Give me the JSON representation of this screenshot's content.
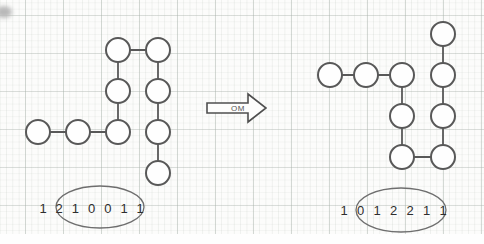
{
  "figure": {
    "arrow": {
      "label": "OM",
      "points": "207,103 248,103 248,94 266,108 248,122 248,113 207,113"
    },
    "structures": [
      {
        "name": "initial-conformation",
        "node_radius": 12,
        "nodes": [
          [
            38,
            132
          ],
          [
            78,
            132
          ],
          [
            118,
            132
          ],
          [
            118,
            91
          ],
          [
            118,
            50
          ],
          [
            158,
            50
          ],
          [
            158,
            91
          ],
          [
            158,
            132
          ],
          [
            158,
            173
          ]
        ],
        "sequence": {
          "digits": [
            "1",
            "2",
            "1",
            "0",
            "0",
            "1",
            "1"
          ],
          "x_start": 43,
          "x_step": 16.2,
          "y": 213
        },
        "ellipse": {
          "cx": 100,
          "cy": 207,
          "rx": 44,
          "ry": 21
        }
      },
      {
        "name": "transformed-conformation",
        "node_radius": 12,
        "nodes": [
          [
            330,
            75
          ],
          [
            366,
            75
          ],
          [
            402,
            75
          ],
          [
            402,
            116
          ],
          [
            402,
            157
          ],
          [
            443,
            157
          ],
          [
            443,
            116
          ],
          [
            443,
            75
          ],
          [
            443,
            34
          ]
        ],
        "sequence": {
          "digits": [
            "1",
            "0",
            "1",
            "2",
            "2",
            "1",
            "1"
          ],
          "x_start": 344,
          "x_step": 16.5,
          "y": 215
        },
        "ellipse": {
          "cx": 401,
          "cy": 210,
          "rx": 45,
          "ry": 22
        }
      }
    ],
    "colors": {
      "node_stroke": "#585858",
      "node_fill": "#fefefe",
      "bond_stroke": "#585858",
      "digit": "#2e2e2e",
      "ellipse_stroke": "#6e6e6e",
      "arrow_stroke": "#4f4f4f",
      "arrow_label": "#555555"
    }
  }
}
